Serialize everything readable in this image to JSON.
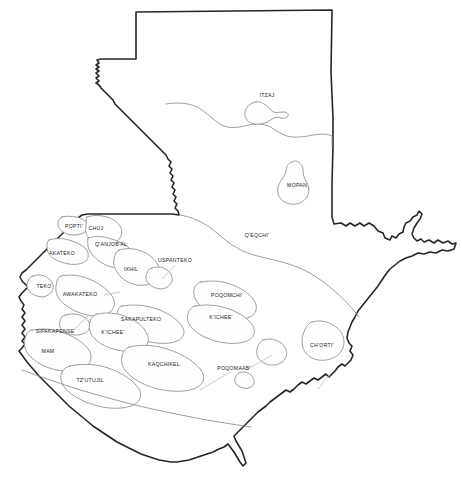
{
  "map": {
    "title": "Mapa lingüístico de Guatemala",
    "country": "Guatemala",
    "background_color": "#ffffff",
    "national_border_color": "#262626",
    "region_border_color": "#8c8c8c",
    "label_color": "#1a1a1a",
    "regions": [
      {
        "id": "itzaj",
        "label": "ITZAJ",
        "x": 267,
        "y": 96,
        "group": "yucatecan"
      },
      {
        "id": "mopan",
        "label": "MOPAN",
        "x": 297,
        "y": 186,
        "group": "yucatecan"
      },
      {
        "id": "qeqchi",
        "label": "Q'EQCHI'",
        "x": 257,
        "y": 236,
        "group": "kichean"
      },
      {
        "id": "popti",
        "label": "POPTI'",
        "x": 74,
        "y": 227,
        "group": "qanjobalan"
      },
      {
        "id": "chuj",
        "label": "CHUJ",
        "x": 96,
        "y": 229,
        "group": "qanjobalan"
      },
      {
        "id": "qanjobal",
        "label": "Q'ANJOB'AL",
        "x": 111,
        "y": 245,
        "group": "qanjobalan"
      },
      {
        "id": "akateko",
        "label": "AKATEKO",
        "x": 62,
        "y": 254,
        "group": "qanjobalan"
      },
      {
        "id": "ixhil",
        "label": "IXHIL",
        "x": 131,
        "y": 270,
        "group": "mamean"
      },
      {
        "id": "uspanteko",
        "label": "USPANTEKO",
        "x": 175,
        "y": 261,
        "group": "kichean"
      },
      {
        "id": "teko",
        "label": "TEKO",
        "x": 44,
        "y": 287,
        "group": "mamean"
      },
      {
        "id": "awakateko",
        "label": "AWAKATEKO",
        "x": 80,
        "y": 295,
        "group": "mamean"
      },
      {
        "id": "poqomchi",
        "label": "POQOMCHI'",
        "x": 227,
        "y": 296,
        "group": "kichean"
      },
      {
        "id": "sakapulteko",
        "label": "SAKAPULTEKO",
        "x": 141,
        "y": 320,
        "group": "kichean"
      },
      {
        "id": "kichee-east",
        "label": "K'ICHEE'",
        "x": 221,
        "y": 318,
        "group": "kichean"
      },
      {
        "id": "sipakapense",
        "label": "SIPAKAPENSE",
        "x": 55,
        "y": 332,
        "group": "kichean"
      },
      {
        "id": "kichee-west",
        "label": "K'ICHEE'",
        "x": 113,
        "y": 333,
        "group": "kichean"
      },
      {
        "id": "mam",
        "label": "MAM",
        "x": 48,
        "y": 352,
        "group": "mamean"
      },
      {
        "id": "chorti",
        "label": "CH'ORTI'",
        "x": 322,
        "y": 346,
        "group": "cholan"
      },
      {
        "id": "kaqchikel",
        "label": "KAQCHIKEL",
        "x": 164,
        "y": 365,
        "group": "kichean"
      },
      {
        "id": "poqomaab",
        "label": "POQOMAAB'",
        "x": 234,
        "y": 369,
        "group": "kichean"
      },
      {
        "id": "tzutujil",
        "label": "TZ'UTUJIL",
        "x": 90,
        "y": 381,
        "group": "kichean"
      }
    ]
  }
}
